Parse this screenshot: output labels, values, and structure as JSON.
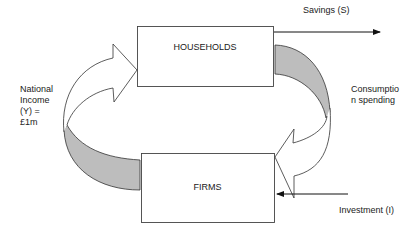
{
  "diagram": {
    "type": "circular-flow-of-income",
    "nodes": [
      {
        "id": "households",
        "label": "HOUSEHOLDS"
      },
      {
        "id": "firms",
        "label": "FIRMS"
      }
    ],
    "flows": [
      {
        "id": "national-income",
        "from": "firms",
        "to": "households",
        "label_lines": [
          "National",
          "Income",
          "(Y) =",
          "£1m"
        ]
      },
      {
        "id": "consumption",
        "from": "households",
        "to": "firms",
        "label_lines": [
          "Consumptio",
          "n spending"
        ]
      },
      {
        "id": "savings",
        "from": "households",
        "to": "outside",
        "label": "Savings (S)"
      },
      {
        "id": "investment",
        "from": "outside",
        "to": "firms",
        "label": "Investment (I)"
      }
    ]
  },
  "colors": {
    "stroke": "#333333",
    "ribbon_fill": "#bdbdbd",
    "background": "#ffffff"
  }
}
